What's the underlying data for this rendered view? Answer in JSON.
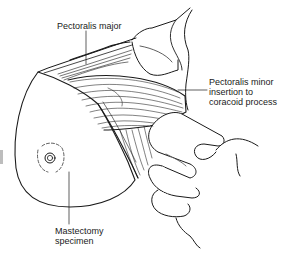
{
  "figure": {
    "type": "surgical-illustration",
    "labels": {
      "pectoralis_major": "Pectoralis major",
      "pectoralis_minor": [
        "Pectoralis minor",
        "insertion to",
        "coracoid process"
      ],
      "mastectomy_specimen": [
        "Mastectomy",
        "specimen"
      ]
    },
    "colors": {
      "ink": "#1a1a1a",
      "background": "#ffffff",
      "side_tab": "#bdbdbd"
    }
  }
}
